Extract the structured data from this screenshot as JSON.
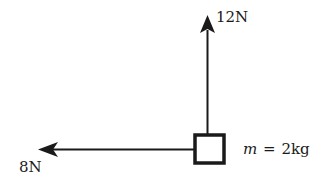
{
  "diagram": {
    "type": "free-body-diagram",
    "colors": {
      "ink": "#1a1a1a",
      "background": "#ffffff"
    },
    "body": {
      "shape": "square",
      "mass_label": {
        "symbol": "m",
        "equals": "=",
        "value": "2kg"
      }
    },
    "forces": [
      {
        "id": "up",
        "direction": "up",
        "label": "12N"
      },
      {
        "id": "left",
        "direction": "left",
        "label": "8N"
      }
    ]
  }
}
